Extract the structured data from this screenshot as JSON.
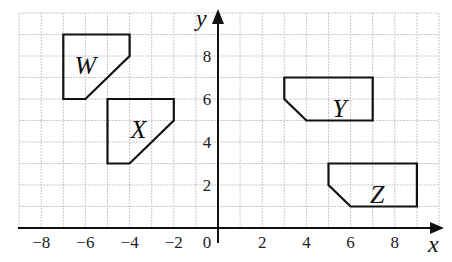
{
  "diagram": {
    "type": "coordinate-grid-transformations",
    "x_axis": {
      "label": "x",
      "min": -9,
      "max": 10,
      "ticks": [
        "-8",
        "-6",
        "-4",
        "-2",
        "2",
        "4",
        "6",
        "8"
      ],
      "origin_label": "0"
    },
    "y_axis": {
      "label": "y",
      "min": 0,
      "max": 10,
      "ticks": [
        "2",
        "4",
        "6",
        "8"
      ]
    },
    "shapes": [
      {
        "name": "W",
        "vertices": [
          [
            -7,
            9
          ],
          [
            -4,
            9
          ],
          [
            -4,
            8
          ],
          [
            -6,
            6
          ],
          [
            -7,
            6
          ]
        ],
        "label_pos": [
          -6,
          7.6
        ]
      },
      {
        "name": "X",
        "vertices": [
          [
            -5,
            6
          ],
          [
            -2,
            6
          ],
          [
            -2,
            5
          ],
          [
            -4,
            3
          ],
          [
            -5,
            3
          ]
        ],
        "label_pos": [
          -3.6,
          4.6
        ]
      },
      {
        "name": "Y",
        "vertices": [
          [
            3,
            7
          ],
          [
            7,
            7
          ],
          [
            7,
            5
          ],
          [
            4,
            5
          ],
          [
            3,
            6
          ]
        ],
        "label_pos": [
          5.5,
          5.6
        ]
      },
      {
        "name": "Z",
        "vertices": [
          [
            5,
            3
          ],
          [
            9,
            3
          ],
          [
            9,
            1
          ],
          [
            6,
            1
          ],
          [
            5,
            2
          ]
        ],
        "label_pos": [
          7.2,
          1.6
        ]
      }
    ],
    "colors": {
      "grid": "#c8c8c8",
      "axis": "#111111",
      "shape": "#111111"
    }
  }
}
